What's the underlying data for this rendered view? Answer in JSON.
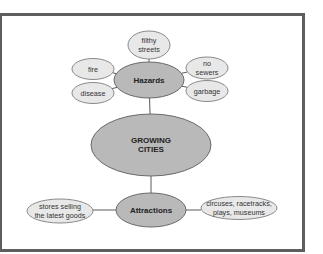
{
  "diagram": {
    "type": "concept-web",
    "colors": {
      "frame": "#5e5e5e",
      "main_fill": "#b9b9b9",
      "main_stroke": "#6a6a6a",
      "leaf_fill": "#e8e8e8",
      "leaf_stroke": "#8a8a8a",
      "connector": "#5a5a5a"
    },
    "center": {
      "label_lines": [
        "GROWING",
        "CITIES"
      ]
    },
    "branches": [
      {
        "id": "hazards",
        "label": "Hazards",
        "children": [
          {
            "id": "filthy-streets",
            "label_lines": [
              "filthy",
              "streets"
            ]
          },
          {
            "id": "fire",
            "label_lines": [
              "fire"
            ]
          },
          {
            "id": "no-sewers",
            "label_lines": [
              "no",
              "sewers"
            ]
          },
          {
            "id": "disease",
            "label_lines": [
              "disease"
            ]
          },
          {
            "id": "garbage",
            "label_lines": [
              "garbage"
            ]
          }
        ]
      },
      {
        "id": "attractions",
        "label": "Attractions",
        "children": [
          {
            "id": "stores",
            "label_lines": [
              "stores selling",
              "the latest goods"
            ]
          },
          {
            "id": "entertainment",
            "label_lines": [
              "circuses, racetracks,",
              "plays, museums"
            ]
          }
        ]
      }
    ]
  }
}
